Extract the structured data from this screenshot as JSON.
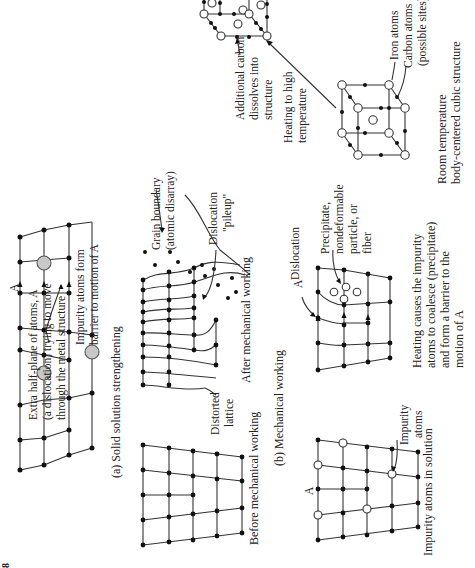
{
  "figure": {
    "orientation": "rotated 90 degrees counter-clockwise",
    "panels": {
      "a": {
        "caption": "(a) Solid solution strengthening",
        "labels": {
          "dislocation_line1": "Extra half-plane of atoms, A",
          "dislocation_line2": "(a dislocation) trying to move",
          "dislocation_line3": "through the metal structure",
          "impurity_line1": "Impurity atoms form",
          "impurity_line2": "barrier to motion of A",
          "marker": "A"
        }
      },
      "b": {
        "caption": "(b) Mechanical working",
        "before_label": "Before mechanical working",
        "after_label": "After mechanical working",
        "labels": {
          "distorted_line1": "Distorted",
          "distorted_line2": "lattice",
          "grain_line1": "Grain boundary",
          "grain_line2": "(atomic disarray)",
          "pileup_line1": "Dislocation",
          "pileup_line2": "\"pileup\""
        }
      },
      "c": {
        "solution_caption": "Impurity atoms in solution",
        "impurity_line1": "Impurity",
        "impurity_line2": "atoms",
        "marker": "A",
        "precipitate_caption_line1": "Heating causes the impurity",
        "precipitate_caption_line2": "atoms to coalesce (precipitate)",
        "precipitate_caption_line3": "and form a barrier to the",
        "precipitate_caption_line4": "motion of A",
        "dislocation": "Dislocation",
        "precip_line1": "Precipitate,",
        "precip_line2": "nondeformable",
        "precip_line3": "particle, or",
        "precip_line4": "fiber",
        "marker2": "A"
      },
      "d": {
        "room_line1": "Room temperature",
        "room_line2": "body-centered cubic structure",
        "iron": "Iron atoms",
        "carbon_line1": "Carbon atoms",
        "carbon_line2": "(possible sites)",
        "heating_line1": "Heating to high",
        "heating_line2": "temperature",
        "additional_line1": "Additional carbon",
        "additional_line2": "dissolves into",
        "additional_line3": "structure"
      }
    },
    "corner_mark": "8"
  }
}
